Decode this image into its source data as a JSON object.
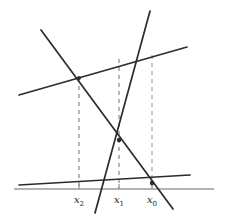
{
  "figure": {
    "width": 228,
    "height": 219,
    "background": "#ffffff",
    "colors": {
      "solid_line": "#2b2b2b",
      "axis": "#9a9a9a",
      "dashed_dark": "#7a7a7a",
      "dashed_light": "#b0b0b0",
      "label_text": "#1a1a1a",
      "tick": "#8a8a8a"
    }
  },
  "axis": {
    "name": "horizontal-axis",
    "x1": 14,
    "y1": 189,
    "x2": 214,
    "y2": 189,
    "stroke_width": 1.4
  },
  "lines": [
    {
      "id": "upper-shallow-line",
      "label": "upper rising line",
      "x1": 19,
      "y1": 95,
      "x2": 187,
      "y2": 47,
      "stroke_width": 1.7
    },
    {
      "id": "lower-shallow-line",
      "label": "lower rising line",
      "x1": 19,
      "y1": 185,
      "x2": 190,
      "y2": 175,
      "stroke_width": 1.7
    },
    {
      "id": "descending-steep-line",
      "label": "steep descending line",
      "x1": 41,
      "y1": 30,
      "x2": 173,
      "y2": 209,
      "stroke_width": 1.7
    },
    {
      "id": "ascending-steep-line",
      "label": "steep ascending line",
      "x1": 150,
      "y1": 11,
      "x2": 95,
      "y2": 213,
      "stroke_width": 1.7
    }
  ],
  "dashed_drops": [
    {
      "id": "drop-x2",
      "x": 79,
      "y_top": 78,
      "y_bottom": 189,
      "color_key": "dashed_dark",
      "stroke_width": 1.1,
      "dash": "4 4"
    },
    {
      "id": "drop-x1",
      "x": 119,
      "y_top": 59,
      "y_bottom": 189,
      "color_key": "dashed_dark",
      "stroke_width": 1.1,
      "dash": "4 4"
    },
    {
      "id": "drop-x0",
      "x": 152,
      "y_top": 55,
      "y_bottom": 189,
      "color_key": "dashed_light",
      "stroke_width": 1.4,
      "dash": "4 4"
    }
  ],
  "intersection_points": [
    {
      "id": "point-upper-left",
      "x": 79,
      "y": 78,
      "r": 1.9
    },
    {
      "id": "point-center",
      "x": 119,
      "y": 140,
      "r": 2.2
    },
    {
      "id": "point-lower-right",
      "x": 152,
      "y": 183,
      "r": 2.2
    }
  ],
  "ticks": [
    {
      "id": "tick-x2",
      "x": 79,
      "y_top": 184,
      "y_bottom": 189
    },
    {
      "id": "tick-x1",
      "x": 119,
      "y_top": 184,
      "y_bottom": 189
    },
    {
      "id": "tick-x0",
      "x": 152,
      "y_top": 184,
      "y_bottom": 189
    }
  ],
  "labels": [
    {
      "id": "label-x2",
      "base": "x",
      "subscript": "2",
      "x": 79,
      "y": 203
    },
    {
      "id": "label-x1",
      "base": "x",
      "subscript": "1",
      "x": 119,
      "y": 203
    },
    {
      "id": "label-x0",
      "base": "x",
      "subscript": "0",
      "x": 152,
      "y": 203
    }
  ],
  "chart_data": {
    "type": "line",
    "title": "",
    "xlabel": "",
    "ylabel": "",
    "grid": false,
    "legend": "none",
    "series": [
      {
        "name": "upper rising line",
        "x": [
          19,
          187
        ],
        "y": [
          95,
          47
        ]
      },
      {
        "name": "lower rising line",
        "x": [
          19,
          190
        ],
        "y": [
          185,
          175
        ]
      },
      {
        "name": "steep descending line",
        "x": [
          41,
          173
        ],
        "y": [
          30,
          209
        ]
      },
      {
        "name": "steep ascending line",
        "x": [
          150,
          95
        ],
        "y": [
          11,
          213
        ]
      }
    ],
    "annotations": [
      {
        "text": "x2",
        "x": 79,
        "y": 203
      },
      {
        "text": "x1",
        "x": 119,
        "y": 203
      },
      {
        "text": "x0",
        "x": 152,
        "y": 203
      }
    ],
    "xlim": [
      0,
      228
    ],
    "ylim": [
      219,
      0
    ]
  }
}
